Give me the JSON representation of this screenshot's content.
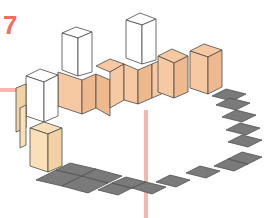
{
  "figure": {
    "number": "7",
    "number_color": "#f07060"
  },
  "colors": {
    "tile_gray": "#7a7a7a",
    "tile_stroke": "#505050",
    "block_orange": "#f7c9a3",
    "block_orange_side": "#efb98f",
    "block_yellow": "#fae0b8",
    "block_yellow_side": "#f2d2a2",
    "block_white": "#ffffff",
    "edge": "#4a4a4a",
    "guide_line": "#f6b8ae"
  },
  "guides": [
    {
      "orientation": "horizontal",
      "x1": 0,
      "y1": 90,
      "x2": 24,
      "y2": 90
    },
    {
      "orientation": "vertical",
      "x1": 146,
      "y1": 110,
      "x2": 146,
      "y2": 218
    }
  ]
}
